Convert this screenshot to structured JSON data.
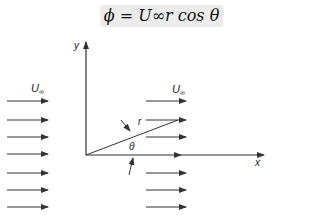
{
  "equation": {
    "text": "ϕ = U∞r cos θ"
  },
  "labels": {
    "y_axis": "y",
    "x_axis": "x",
    "u_inf_left": "U",
    "u_inf_left_sub": "∞",
    "u_inf_right": "U",
    "u_inf_right_sub": "∞",
    "radius": "r",
    "angle": "θ"
  },
  "colors": {
    "line": "#333333",
    "equation_bg": "#ececec"
  },
  "arrows": {
    "left_stream_y": [
      101,
      120,
      137,
      154,
      173,
      190,
      207
    ],
    "right_stream_y": [
      101,
      120,
      137,
      173,
      190,
      207
    ]
  }
}
